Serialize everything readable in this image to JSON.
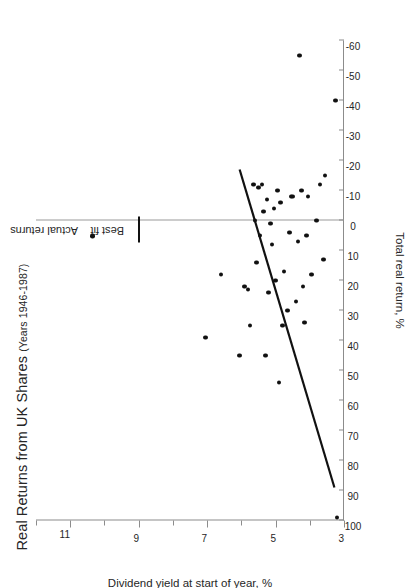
{
  "page": {
    "artifact_text": ""
  },
  "chart_data": {
    "type": "scatter",
    "title": "Real Returns from UK Shares",
    "subtitle": "(Years 1946-1987)",
    "xlabel": "Dividend yield at start of year, %",
    "ylabel": "Total real return, %",
    "orientation": "rotated-90-ccw",
    "grid": false,
    "zero_reference_line": 0,
    "xlim": [
      3,
      12
    ],
    "ylim": [
      -60,
      100
    ],
    "xticks": [
      3,
      4,
      5,
      6,
      7,
      8,
      9,
      10,
      11,
      12
    ],
    "xticklabels": [
      "3",
      "",
      "5",
      "",
      "7",
      "",
      "9",
      "",
      "11",
      ""
    ],
    "yticks": [
      100,
      90,
      80,
      70,
      60,
      50,
      40,
      30,
      20,
      10,
      0,
      -10,
      -20,
      -30,
      -40,
      -50,
      -60
    ],
    "yticklabels": [
      "100",
      "90",
      "80",
      "70",
      "60",
      "50",
      "40",
      "30",
      "20",
      "10",
      "0",
      "-10",
      "-20",
      "-30",
      "-40",
      "-50",
      "-60"
    ],
    "legend": {
      "position": "right",
      "entries": [
        {
          "label": "Actual returns",
          "marker": "dot"
        },
        {
          "label": "Best fit",
          "marker": "line"
        }
      ]
    },
    "series": [
      {
        "name": "Actual returns",
        "marker": "dot",
        "points": [
          [
            3.2,
            99
          ],
          [
            3.25,
            -40
          ],
          [
            3.55,
            -15
          ],
          [
            3.6,
            13
          ],
          [
            3.7,
            -12
          ],
          [
            3.8,
            0
          ],
          [
            3.95,
            18
          ],
          [
            4.05,
            -8
          ],
          [
            4.1,
            5
          ],
          [
            4.15,
            34
          ],
          [
            4.2,
            22
          ],
          [
            4.25,
            -10
          ],
          [
            4.3,
            -55
          ],
          [
            4.35,
            7
          ],
          [
            4.4,
            27
          ],
          [
            4.5,
            -8
          ],
          [
            4.55,
            -8
          ],
          [
            4.6,
            4
          ],
          [
            4.65,
            30
          ],
          [
            4.75,
            17
          ],
          [
            4.8,
            35
          ],
          [
            4.85,
            -6
          ],
          [
            4.9,
            54
          ],
          [
            4.95,
            -10
          ],
          [
            5.0,
            20
          ],
          [
            5.05,
            -4
          ],
          [
            5.1,
            8
          ],
          [
            5.15,
            1
          ],
          [
            5.2,
            24
          ],
          [
            5.25,
            -7
          ],
          [
            5.3,
            45
          ],
          [
            5.35,
            -3
          ],
          [
            5.4,
            -12
          ],
          [
            5.45,
            5
          ],
          [
            5.5,
            -11
          ],
          [
            5.55,
            14
          ],
          [
            5.6,
            0
          ],
          [
            5.65,
            -12
          ],
          [
            5.75,
            35
          ],
          [
            5.8,
            23
          ],
          [
            5.9,
            22
          ],
          [
            6.05,
            45
          ],
          [
            6.6,
            18
          ],
          [
            7.05,
            39
          ]
        ]
      }
    ],
    "best_fit": {
      "name": "Best fit",
      "x_start": 3.28,
      "y_start": 89,
      "x_end": 6.05,
      "y_end": -17
    }
  }
}
